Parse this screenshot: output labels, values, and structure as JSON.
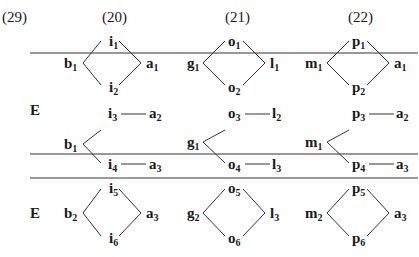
{
  "example_number": "(29)",
  "columns": [
    "(20)",
    "(21)",
    "(22)"
  ],
  "row_labels": {
    "middle": "E",
    "bottom": "E"
  },
  "nodes": {
    "c1": {
      "top": {
        "left": [
          "b",
          "1"
        ],
        "up": [
          "i",
          "1"
        ],
        "down": [
          "i",
          "2"
        ],
        "right": [
          "a",
          "1"
        ]
      },
      "mid": {
        "left": [
          "b",
          "1"
        ],
        "up": [
          "i",
          "3"
        ],
        "up_right": [
          "a",
          "2"
        ],
        "down": [
          "i",
          "4"
        ],
        "down_right": [
          "a",
          "3"
        ]
      },
      "bot": {
        "left": [
          "b",
          "2"
        ],
        "up": [
          "i",
          "5"
        ],
        "down": [
          "i",
          "6"
        ],
        "right": [
          "a",
          "3"
        ]
      }
    },
    "c2": {
      "top": {
        "left": [
          "g",
          "1"
        ],
        "up": [
          "o",
          "1"
        ],
        "down": [
          "o",
          "2"
        ],
        "right": [
          "l",
          "1"
        ]
      },
      "mid": {
        "left": [
          "g",
          "1"
        ],
        "up": [
          "o",
          "3"
        ],
        "up_right": [
          "l",
          "2"
        ],
        "down": [
          "o",
          "4"
        ],
        "down_right": [
          "l",
          "3"
        ]
      },
      "bot": {
        "left": [
          "g",
          "2"
        ],
        "up": [
          "o",
          "5"
        ],
        "down": [
          "o",
          "6"
        ],
        "right": [
          "l",
          "3"
        ]
      }
    },
    "c3": {
      "top": {
        "left": [
          "m",
          "1"
        ],
        "up": [
          "p",
          "1"
        ],
        "down": [
          "p",
          "2"
        ],
        "right": [
          "a",
          "1"
        ]
      },
      "mid": {
        "left": [
          "m",
          "1"
        ],
        "up": [
          "p",
          "3"
        ],
        "up_right": [
          "a",
          "2"
        ],
        "down": [
          "p",
          "4"
        ],
        "down_right": [
          "a",
          "3"
        ]
      },
      "bot": {
        "left": [
          "m",
          "2"
        ],
        "up": [
          "p",
          "5"
        ],
        "down": [
          "p",
          "6"
        ],
        "right": [
          "a",
          "3"
        ]
      }
    }
  }
}
